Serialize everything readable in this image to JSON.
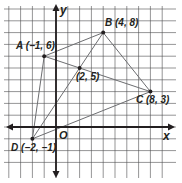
{
  "diagram": {
    "type": "coordinate-plane",
    "axes": {
      "x_label": "x",
      "y_label": "y",
      "origin_label": "O"
    },
    "grid": {
      "x_range": [
        -4,
        9
      ],
      "y_range": [
        -3,
        10
      ],
      "spacing_px": 11.8
    },
    "points": [
      {
        "id": "A",
        "label": "A (−1, 6)",
        "x": -1,
        "y": 6
      },
      {
        "id": "B",
        "label": "B (4, 8)",
        "x": 4,
        "y": 8
      },
      {
        "id": "C",
        "label": "C (8, 3)",
        "x": 8,
        "y": 3
      },
      {
        "id": "D",
        "label": "D (−2, −1)",
        "x": -2,
        "y": -1
      },
      {
        "id": "M",
        "label": "(2, 5)",
        "x": 2,
        "y": 5
      }
    ],
    "segments": [
      [
        "A",
        "B"
      ],
      [
        "B",
        "C"
      ],
      [
        "C",
        "D"
      ],
      [
        "D",
        "A"
      ],
      [
        "A",
        "C"
      ],
      [
        "B",
        "D"
      ]
    ],
    "colors": {
      "grid": "#231f20",
      "lines": "#6d6e71",
      "axes": "#231f20"
    }
  }
}
